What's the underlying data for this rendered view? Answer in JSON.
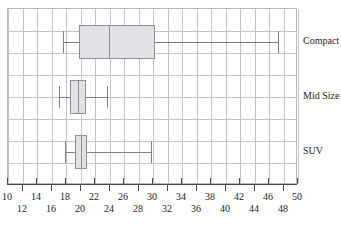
{
  "chart_data": {
    "type": "box",
    "title": "",
    "xlabel": "",
    "ylabel": "",
    "orientation": "horizontal",
    "xlim": [
      10,
      50
    ],
    "xtick_step": 2,
    "xticks": [
      10,
      12,
      14,
      16,
      18,
      20,
      22,
      24,
      26,
      28,
      30,
      32,
      34,
      36,
      38,
      40,
      42,
      44,
      46,
      48,
      50
    ],
    "xticks_top_row": [
      10,
      14,
      18,
      22,
      26,
      30,
      34,
      38,
      42,
      46,
      50
    ],
    "xticks_bottom_row": [
      12,
      16,
      20,
      24,
      28,
      32,
      36,
      40,
      44,
      48
    ],
    "grid": true,
    "legend": "none",
    "categories": [
      "Compact",
      "Mid Size",
      "SUV"
    ],
    "series": [
      {
        "name": "Compact",
        "min": 17.6,
        "q1": 19.8,
        "median": 23.9,
        "q3": 30.3,
        "max": 47.3
      },
      {
        "name": "Mid Size",
        "min": 17.1,
        "q1": 18.6,
        "median": 19.6,
        "q3": 20.8,
        "max": 23.6
      },
      {
        "name": "SUV",
        "min": 17.8,
        "q1": 19.3,
        "median": 20.0,
        "q3": 20.9,
        "max": 29.7
      }
    ],
    "colors": {
      "box_fill": "#e2e2e6",
      "box_border": "#8d8d96",
      "whisker": "#7d7d86",
      "grid": "#c3c3c9",
      "axis": "#4a4a4a",
      "frame": "#b9b9bd",
      "text": "#1a1a1a"
    }
  }
}
